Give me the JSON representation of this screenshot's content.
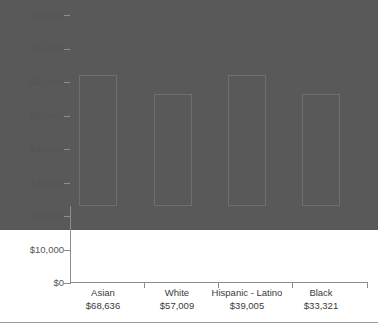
{
  "chart_data": {
    "type": "bar",
    "title": "",
    "subtitle": "",
    "xlabel": "",
    "ylabel": "",
    "categories": [
      "Asian",
      "White",
      "Hispanic - Latino",
      "Black"
    ],
    "values": [
      68636,
      57009,
      39005,
      33321
    ],
    "value_labels": [
      "$68,636",
      "$57,009",
      "$39,005",
      "$33,321"
    ],
    "ylim": [
      0,
      80000
    ],
    "ytick_values": [
      80000,
      70000,
      60000,
      50000,
      40000,
      30000,
      20000,
      10000,
      0
    ],
    "ytick_labels": [
      "$80,000",
      "$70,000",
      "$60,000",
      "$50,000",
      "$40,000",
      "$30,000",
      "$20,000",
      "$10,000",
      "$0"
    ],
    "grid": false,
    "legend": null,
    "series": [
      {
        "name": "Median Household Income",
        "values": [
          68636,
          57009,
          39005,
          33321
        ]
      }
    ],
    "colors": {
      "bar_fill": "#595959",
      "bar_stroke": "#6e6e6e",
      "axis": "#8c8c8c",
      "tick_label": "#555555",
      "category_label": "#3a3a3a",
      "background": "#ffffff",
      "rule": "#9a9a9a"
    }
  }
}
